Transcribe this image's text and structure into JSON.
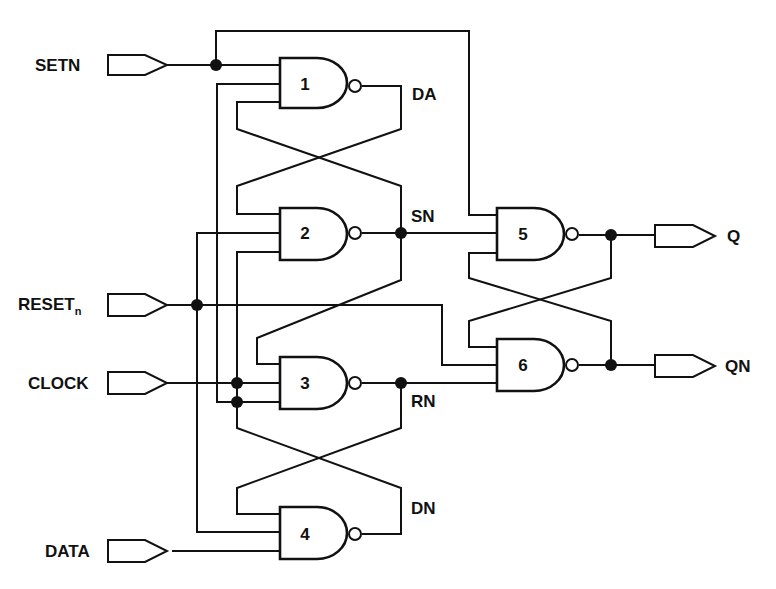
{
  "diagram": {
    "type": "logic-schematic",
    "inputs": [
      {
        "id": "setn",
        "label": "SETN"
      },
      {
        "id": "reset",
        "label": "RESET",
        "subscript": "n"
      },
      {
        "id": "clock",
        "label": "CLOCK"
      },
      {
        "id": "data",
        "label": "DATA"
      }
    ],
    "outputs": [
      {
        "id": "q",
        "label": "Q"
      },
      {
        "id": "qn",
        "label": "QN"
      }
    ],
    "gates": [
      {
        "id": "g1",
        "label": "1",
        "type": "NAND3"
      },
      {
        "id": "g2",
        "label": "2",
        "type": "NAND3"
      },
      {
        "id": "g3",
        "label": "3",
        "type": "NAND3"
      },
      {
        "id": "g4",
        "label": "4",
        "type": "NAND3"
      },
      {
        "id": "g5",
        "label": "5",
        "type": "NAND3"
      },
      {
        "id": "g6",
        "label": "6",
        "type": "NAND3"
      }
    ],
    "nets": [
      {
        "id": "da",
        "label": "DA"
      },
      {
        "id": "sn",
        "label": "SN"
      },
      {
        "id": "rn",
        "label": "RN"
      },
      {
        "id": "dn",
        "label": "DN"
      }
    ],
    "colors": {
      "ink": "#111111",
      "background": "#ffffff"
    }
  }
}
